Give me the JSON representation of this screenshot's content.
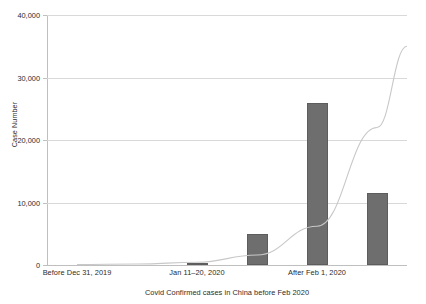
{
  "chart_data": {
    "type": "bar",
    "title": "",
    "xlabel": "Covid Confirmed cases in China before Feb 2020",
    "ylabel": "Case Number",
    "categories": [
      "Before Dec 31, 2019",
      "Jan 1–10, 2020",
      "Jan 11–20, 2020",
      "Jan 21–31, 2020",
      "After Feb 1, 2020",
      "After Feb 10, 2020"
    ],
    "visible_category_labels": [
      "Before Dec 31, 2019",
      "Jan 11–20, 2020",
      "After Feb 1, 2020"
    ],
    "values": [
      0,
      0,
      400,
      5000,
      26000,
      11500
    ],
    "series": [
      {
        "name": "Case Number",
        "values": [
          0,
          0,
          400,
          5000,
          26000,
          11500
        ]
      }
    ],
    "trendline": {
      "type": "exponential",
      "visible": true,
      "color": "#c8c8c8",
      "points": [
        {
          "x": 0,
          "y": 60
        },
        {
          "x": 1,
          "y": 160
        },
        {
          "x": 2,
          "y": 430
        },
        {
          "x": 3,
          "y": 1600
        },
        {
          "x": 4,
          "y": 6200
        },
        {
          "x": 5,
          "y": 22000
        },
        {
          "x": 5.5,
          "y": 35000
        }
      ]
    },
    "ylim": [
      0,
      40000
    ],
    "ytick_values": [
      0,
      10000,
      20000,
      30000,
      40000
    ],
    "ytick_labels": [
      "0",
      "10,000",
      "20,000",
      "30,000",
      "40,000"
    ],
    "grid": true,
    "legend": null,
    "bar_color": "#6e6e6e",
    "gridline_color": "#d9d9d9",
    "axis_color": "#bfbfbf",
    "text_color": "#2b2b2b"
  }
}
